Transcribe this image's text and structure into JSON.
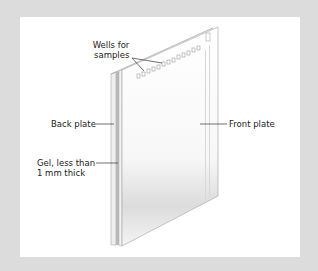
{
  "diagram": {
    "labels": {
      "wells": [
        "Wells for",
        "samples"
      ],
      "back_plate": "Back plate",
      "front_plate": "Front plate",
      "gel": [
        "Gel, less than",
        "1 mm thick"
      ]
    },
    "colors": {
      "background": "#dcdcdc",
      "panel": "#ffffff",
      "plate_edge": "#9a9a9a",
      "gel": "#b8b8b8",
      "leader_line": "#333333"
    },
    "well_count": 13
  }
}
